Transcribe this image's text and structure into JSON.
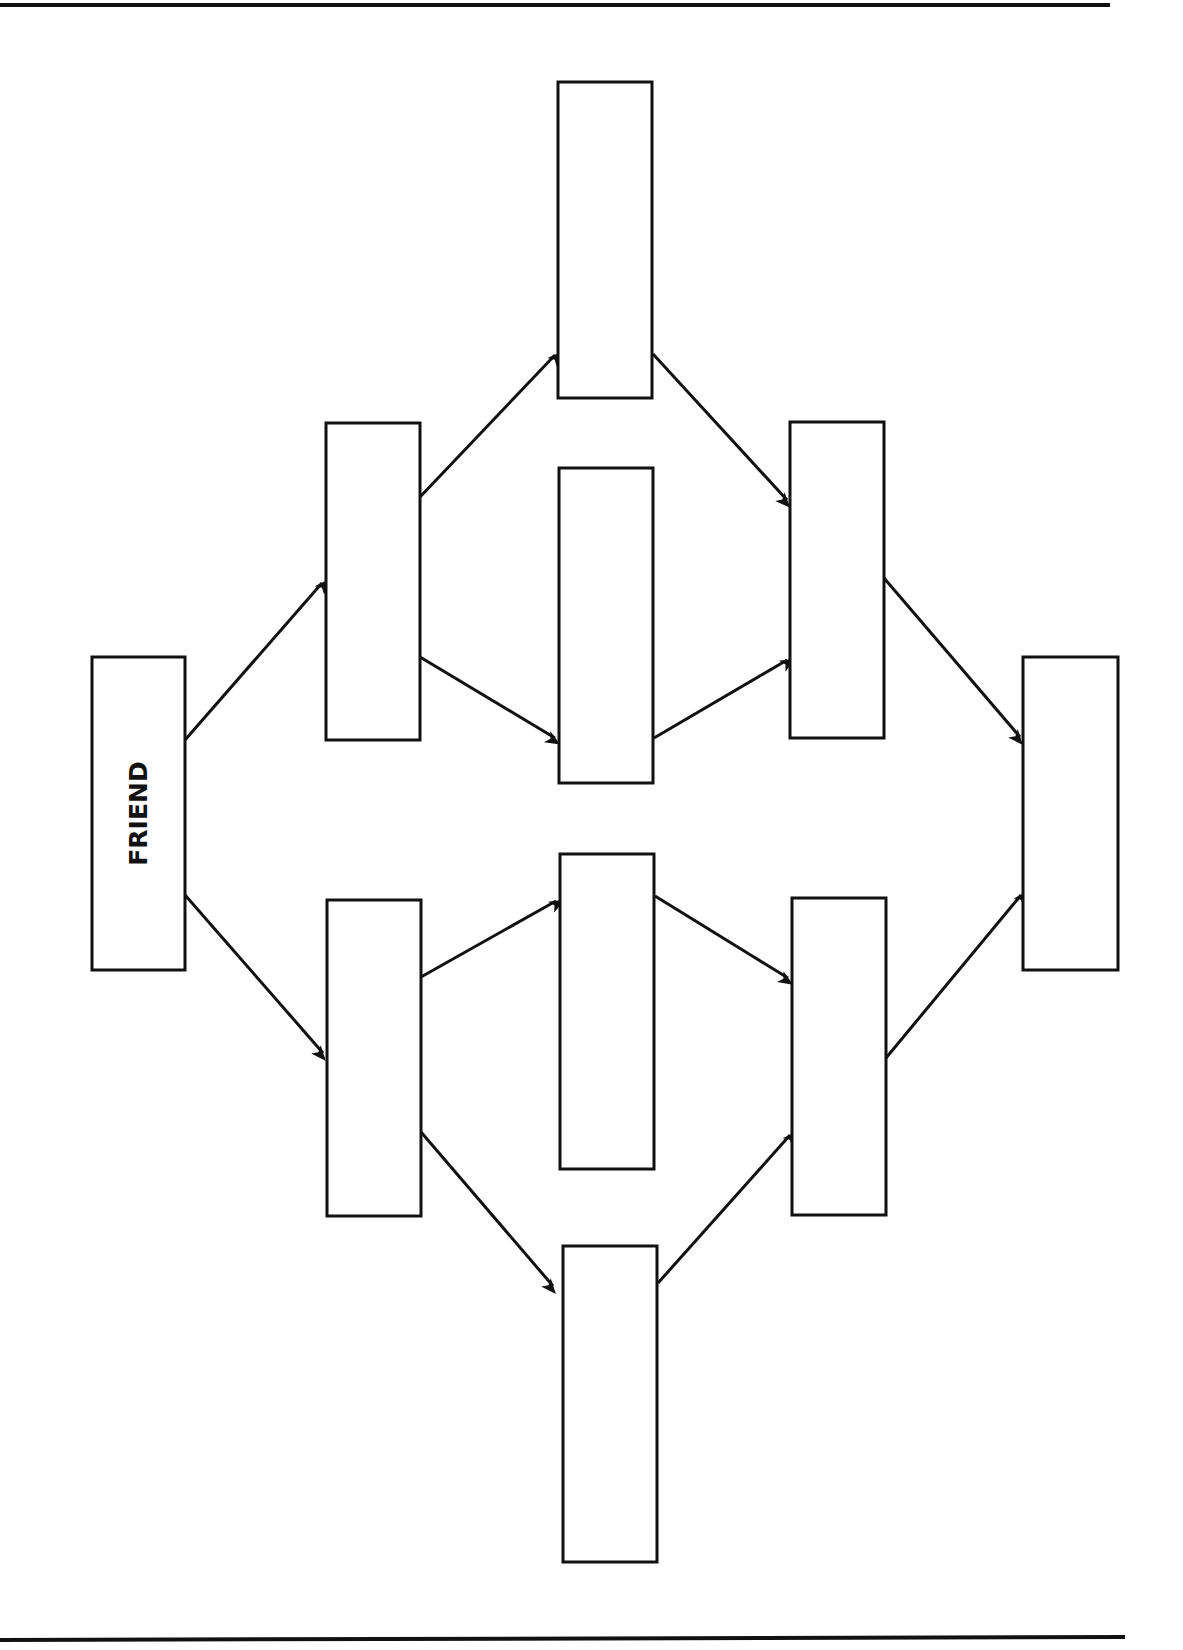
{
  "diagram": {
    "title": "",
    "start_label": "FRIEND",
    "boxes": [
      {
        "id": "friend",
        "label": "FRIEND",
        "x": 92,
        "y": 657,
        "w": 93,
        "h": 313
      },
      {
        "id": "level2-top",
        "label": "",
        "x": 326,
        "y": 423,
        "w": 94,
        "h": 317
      },
      {
        "id": "level2-bottom",
        "label": "",
        "x": 327,
        "y": 900,
        "w": 94,
        "h": 316
      },
      {
        "id": "level3-1",
        "label": "",
        "x": 558,
        "y": 82,
        "w": 94,
        "h": 316
      },
      {
        "id": "level3-2",
        "label": "",
        "x": 559,
        "y": 468,
        "w": 94,
        "h": 315
      },
      {
        "id": "level3-3",
        "label": "",
        "x": 560,
        "y": 854,
        "w": 94,
        "h": 315
      },
      {
        "id": "level3-4",
        "label": "",
        "x": 563,
        "y": 1246,
        "w": 94,
        "h": 316
      },
      {
        "id": "level4-top",
        "label": "",
        "x": 790,
        "y": 422,
        "w": 94,
        "h": 316
      },
      {
        "id": "level4-bottom",
        "label": "",
        "x": 792,
        "y": 898,
        "w": 94,
        "h": 317
      },
      {
        "id": "level5",
        "label": "",
        "x": 1023,
        "y": 657,
        "w": 95,
        "h": 313
      }
    ],
    "arrows": [
      {
        "from": "friend",
        "to": "level2-top",
        "x1": 185,
        "y1": 740,
        "x2": 322,
        "y2": 583
      },
      {
        "from": "friend",
        "to": "level2-bottom",
        "x1": 185,
        "y1": 895,
        "x2": 323,
        "y2": 1053
      },
      {
        "from": "level2-top",
        "to": "level3-1",
        "x1": 420,
        "y1": 497,
        "x2": 555,
        "y2": 355
      },
      {
        "from": "level2-top",
        "to": "level3-2",
        "x1": 420,
        "y1": 657,
        "x2": 555,
        "y2": 738
      },
      {
        "from": "level2-bottom",
        "to": "level3-3",
        "x1": 421,
        "y1": 977,
        "x2": 556,
        "y2": 901
      },
      {
        "from": "level2-bottom",
        "to": "level3-4",
        "x1": 421,
        "y1": 1132,
        "x2": 553,
        "y2": 1286
      },
      {
        "from": "level3-1",
        "to": "level4-top",
        "x1": 653,
        "y1": 354,
        "x2": 787,
        "y2": 500
      },
      {
        "from": "level3-2",
        "to": "level4-top",
        "x1": 654,
        "y1": 738,
        "x2": 787,
        "y2": 660
      },
      {
        "from": "level3-3",
        "to": "level4-bottom",
        "x1": 655,
        "y1": 896,
        "x2": 788,
        "y2": 978
      },
      {
        "from": "level3-4",
        "to": "level4-bottom",
        "x1": 658,
        "y1": 1283,
        "x2": 790,
        "y2": 1135
      },
      {
        "from": "level4-top",
        "to": "level5",
        "x1": 884,
        "y1": 578,
        "x2": 1020,
        "y2": 737
      },
      {
        "from": "level4-bottom",
        "to": "level5",
        "x1": 886,
        "y1": 1058,
        "x2": 1021,
        "y2": 895
      }
    ],
    "rules": [
      {
        "name": "top-rule",
        "x1": 0,
        "y1": 5,
        "x2": 1110,
        "y2": 5
      },
      {
        "name": "bottom-rule",
        "x1": 0,
        "y1": 1640,
        "x2": 1125,
        "y2": 1637
      }
    ],
    "stroke_color": "#111111",
    "background_color": "#ffffff"
  }
}
